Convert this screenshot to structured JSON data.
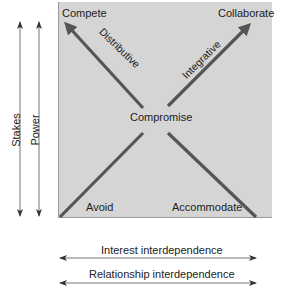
{
  "diagram": {
    "type": "negotiation-strategy-framework",
    "corners": {
      "top_left": "Compete",
      "top_right": "Collaborate",
      "bottom_left": "Avoid",
      "bottom_right": "Accommodate",
      "center": "Compromise"
    },
    "diagonals": {
      "distributive": "Distributive",
      "integrative": "Integrative"
    },
    "vertical_axes": [
      {
        "label": "Stakes",
        "direction": "bidirectional"
      },
      {
        "label": "Power",
        "direction": "bidirectional"
      }
    ],
    "horizontal_axes": [
      {
        "label": "Interest interdependence",
        "direction": "bidirectional"
      },
      {
        "label": "Relationship interdependence",
        "direction": "bidirectional"
      }
    ],
    "colors": {
      "panel": "#d5d5d5",
      "line": "#555555",
      "axis": "#555555",
      "text": "#222222"
    }
  }
}
